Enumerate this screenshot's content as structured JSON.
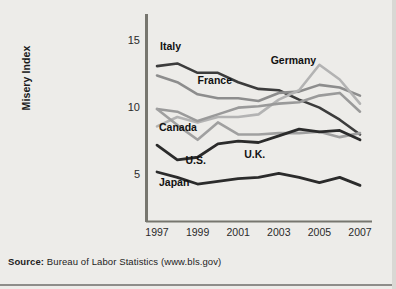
{
  "figure": {
    "source_prefix": "Source:",
    "source_text": " Bureau of Labor Statistics (www.bls.gov)"
  },
  "chart_data": {
    "type": "line",
    "title": "",
    "xlabel": "",
    "ylabel": "Misery Index",
    "x": [
      1997,
      1998,
      1999,
      2000,
      2001,
      2002,
      2003,
      2004,
      2005,
      2006,
      2007
    ],
    "xtick_labels": [
      "1997",
      "1999",
      "2001",
      "2003",
      "2005",
      "2007"
    ],
    "xticks": [
      1997,
      1999,
      2001,
      2003,
      2005,
      2007
    ],
    "ytick_labels": [
      "5",
      "10",
      "15"
    ],
    "yticks": [
      5,
      10,
      15
    ],
    "xlim": [
      1997,
      2007
    ],
    "ylim": [
      0,
      16.3
    ],
    "grid": false,
    "legend_position": "inline-labels",
    "series": [
      {
        "name": "Italy",
        "color": "#3c3c3c",
        "width": 2.6,
        "label_x": 1997.15,
        "label_y": 14.6,
        "values": [
          13.2,
          13.4,
          12.7,
          12.7,
          12.0,
          11.5,
          11.4,
          10.7,
          10.1,
          9.2,
          8.1
        ]
      },
      {
        "name": "France",
        "color": "#8d8d8d",
        "width": 2.6,
        "label_x": 1999.0,
        "label_y": 12.1,
        "values": [
          12.5,
          12.0,
          11.1,
          10.8,
          10.8,
          10.6,
          11.2,
          11.3,
          11.8,
          11.6,
          11.0
        ]
      },
      {
        "name": "Germany",
        "color": "#b3b3b3",
        "width": 2.6,
        "label_x": 2002.6,
        "label_y": 13.6,
        "values": [
          8.7,
          9.4,
          9.0,
          9.4,
          9.4,
          9.6,
          10.7,
          11.4,
          13.3,
          12.2,
          10.4
        ]
      },
      {
        "name": "Canada",
        "color": "#9a9a9a",
        "width": 2.6,
        "label_x": 1997.1,
        "label_y": 8.6,
        "values": [
          10.0,
          9.8,
          9.1,
          9.6,
          10.1,
          10.2,
          10.4,
          10.5,
          11.0,
          11.2,
          9.8
        ]
      },
      {
        "name": "U.K.",
        "color": "#a0a0a0",
        "width": 2.6,
        "label_x": 2001.3,
        "label_y": 6.6,
        "values": [
          10.0,
          8.8,
          7.7,
          9.0,
          8.1,
          8.1,
          8.2,
          8.2,
          8.3,
          7.9,
          8.2
        ]
      },
      {
        "name": "U.S.",
        "color": "#2b2b2b",
        "width": 2.8,
        "label_x": 1998.4,
        "label_y": 6.1,
        "values": [
          7.3,
          6.2,
          6.4,
          7.4,
          7.6,
          7.5,
          8.0,
          8.5,
          8.3,
          8.4,
          7.7
        ]
      },
      {
        "name": "Japan",
        "color": "#2b2b2b",
        "width": 2.8,
        "label_x": 1997.1,
        "label_y": 4.5,
        "values": [
          5.3,
          4.9,
          4.4,
          4.6,
          4.8,
          4.9,
          5.2,
          4.9,
          4.5,
          4.9,
          4.3
        ]
      }
    ]
  }
}
